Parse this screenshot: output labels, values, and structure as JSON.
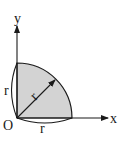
{
  "diagram": {
    "labels": {
      "x_axis": "x",
      "y_axis": "y",
      "origin": "O",
      "radius_left": "r",
      "radius_bottom": "r",
      "radius_diagonal": "r"
    },
    "colors": {
      "fill": "#d3d3d3",
      "stroke": "#1a1a1a",
      "background": "#ffffff"
    }
  }
}
